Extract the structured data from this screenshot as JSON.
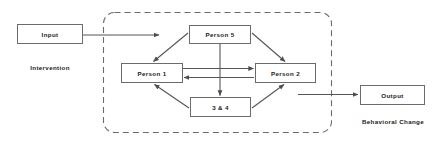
{
  "diagram": {
    "colors": {
      "stroke": "#6b6b6b",
      "arrow": "#555555",
      "dashed_boundary": "#6b6b6b",
      "text": "#1a1a1a",
      "background": "#ffffff"
    },
    "nodes": [
      {
        "id": "input",
        "label": "Input"
      },
      {
        "id": "person5",
        "label": "Person 5"
      },
      {
        "id": "person1",
        "label": "Person 1"
      },
      {
        "id": "person2",
        "label": "Person 2"
      },
      {
        "id": "group34",
        "label": "3 & 4"
      },
      {
        "id": "output",
        "label": "Output"
      }
    ],
    "captions": [
      {
        "id": "intervention",
        "label": "Intervention"
      },
      {
        "id": "behavioral_change",
        "label": "Behavioral Change"
      }
    ],
    "boundary": {
      "style": "dashed-rounded-rectangle",
      "label": ""
    },
    "edges": [
      {
        "from": "input",
        "to": "boundary",
        "kind": "arrow-right"
      },
      {
        "from": "person5",
        "to": "person1",
        "kind": "arrow-diagonal-down-left"
      },
      {
        "from": "person5",
        "to": "person2",
        "kind": "arrow-diagonal-down-right"
      },
      {
        "from": "person5",
        "to": "group34",
        "kind": "arrow-down"
      },
      {
        "from": "person1",
        "to": "person2",
        "kind": "arrow-right"
      },
      {
        "from": "person2",
        "to": "person1",
        "kind": "arrow-left"
      },
      {
        "from": "group34",
        "to": "person1",
        "kind": "arrow-diagonal-up-left"
      },
      {
        "from": "group34",
        "to": "person2",
        "kind": "arrow-diagonal-up-right"
      },
      {
        "from": "boundary",
        "to": "output",
        "kind": "arrow-right"
      }
    ]
  }
}
